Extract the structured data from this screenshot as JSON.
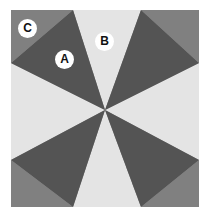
{
  "figure": {
    "title": "",
    "alt_description": "Radial pinwheel pattern of triangular wedges converging at a central point, with three circular letter labels",
    "canvas": {
      "width": 210,
      "height": 217,
      "background": "#ffffff"
    },
    "content_box": {
      "left": 11,
      "top": 10,
      "right": 199,
      "bottom": 207
    },
    "center_point": {
      "x": 105,
      "y": 110
    },
    "colors": {
      "corner_gray": "#808080",
      "wedge_dark": "#545454",
      "wedge_light": "#e4e4e4",
      "background": "#ffffff",
      "label_fill": "#ffffff",
      "label_text": "#111111"
    },
    "regions": [
      {
        "id": "corner-top-left",
        "color_role": "corner_gray"
      },
      {
        "id": "corner-top-right",
        "color_role": "corner_gray"
      },
      {
        "id": "corner-bottom-left",
        "color_role": "corner_gray"
      },
      {
        "id": "corner-bottom-right",
        "color_role": "corner_gray"
      },
      {
        "id": "wedge-upper-left",
        "color_role": "wedge_dark"
      },
      {
        "id": "wedge-upper-right",
        "color_role": "wedge_dark"
      },
      {
        "id": "wedge-lower-left",
        "color_role": "wedge_dark"
      },
      {
        "id": "wedge-lower-right",
        "color_role": "wedge_dark"
      },
      {
        "id": "wedge-top",
        "color_role": "wedge_light"
      },
      {
        "id": "wedge-bottom",
        "color_role": "wedge_light"
      },
      {
        "id": "wedge-left",
        "color_role": "wedge_light"
      },
      {
        "id": "wedge-right",
        "color_role": "wedge_light"
      }
    ],
    "labels": [
      {
        "id": "a",
        "text": "A",
        "x": 64,
        "y": 59,
        "on_region": "wedge-upper-left"
      },
      {
        "id": "b",
        "text": "B",
        "x": 104,
        "y": 41,
        "on_region": "wedge-top"
      },
      {
        "id": "c",
        "text": "C",
        "x": 27,
        "y": 28,
        "on_region": "corner-top-left"
      }
    ]
  }
}
